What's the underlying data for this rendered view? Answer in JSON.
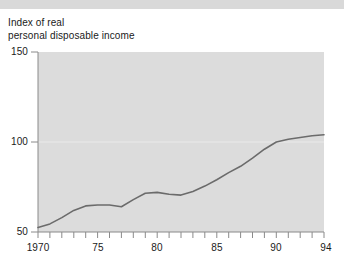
{
  "chart_data": {
    "type": "line",
    "title": "Index of real personal disposable income",
    "title_lines": [
      "Index of real",
      "personal disposable income"
    ],
    "xlabel": "",
    "ylabel": "",
    "ylim": [
      50,
      150
    ],
    "xlim": [
      1970,
      1994
    ],
    "yticks": [
      50,
      100,
      150
    ],
    "ytick_labels": [
      "50",
      "100",
      "150"
    ],
    "xticks": [
      1970,
      1975,
      1980,
      1985,
      1990,
      1994
    ],
    "xtick_labels": [
      "1970",
      "75",
      "80",
      "85",
      "90",
      "94"
    ],
    "xtick_minor_interval": 1,
    "grid": true,
    "gridlines_y": [
      100
    ],
    "legend": null,
    "legend_position": "none",
    "plot_background": "#dcdcdc",
    "line_color": "#6b6b6b",
    "series": [
      {
        "name": "Index of real personal disposable income",
        "x": [
          1970,
          1971,
          1972,
          1973,
          1974,
          1975,
          1976,
          1977,
          1978,
          1979,
          1980,
          1981,
          1982,
          1983,
          1984,
          1985,
          1986,
          1987,
          1988,
          1989,
          1990,
          1991,
          1992,
          1993,
          1994
        ],
        "values": [
          52.5,
          54.5,
          58.0,
          62.0,
          64.5,
          65.0,
          65.0,
          64.0,
          68.0,
          71.5,
          72.0,
          71.0,
          70.5,
          72.5,
          75.5,
          79.0,
          83.0,
          86.5,
          91.0,
          96.0,
          100.0,
          101.5,
          102.5,
          103.5,
          104.0
        ]
      }
    ]
  },
  "axes": {
    "y_tick_50": "50",
    "y_tick_100": "100",
    "y_tick_150": "150",
    "x_tick_1970": "1970",
    "x_tick_75": "75",
    "x_tick_80": "80",
    "x_tick_85": "85",
    "x_tick_90": "90",
    "x_tick_94": "94"
  },
  "title": {
    "line1": "Index of real",
    "line2": "personal disposable income"
  }
}
